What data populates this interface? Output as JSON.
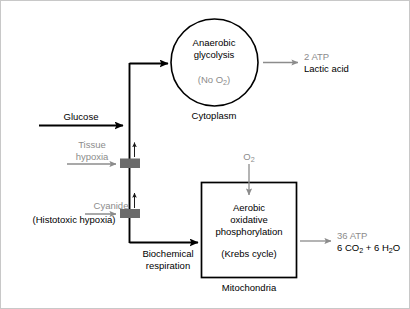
{
  "diagram": {
    "colors": {
      "black": "#000000",
      "gray_text": "#8c8c8c",
      "gray_arrow": "#8c8c8c",
      "block_gray": "#6b6b6b",
      "background": "#ffffff"
    },
    "inputs": {
      "glucose_label": "Glucose",
      "tissue_hypoxia_line1": "Tissue",
      "tissue_hypoxia_line2": "hypoxia",
      "cyanide_label": "Cyanide",
      "histotoxic_label": "(Histotoxic hypoxia)",
      "oxygen_label": "O",
      "oxygen_sub": "2"
    },
    "pathway": {
      "branch_label_line1": "Biochemical",
      "branch_label_line2": "respiration"
    },
    "anaerobic": {
      "title_line1": "Anaerobic",
      "title_line2": "glycolysis",
      "condition_prefix": "(No O",
      "condition_sub": "2",
      "condition_suffix": ")",
      "compartment_label": "Cytoplasm",
      "output_atp": "2 ATP",
      "output_product": "Lactic acid"
    },
    "aerobic": {
      "title_line1": "Aerobic",
      "title_line2": "oxidative",
      "title_line3": "phosphorylation",
      "cycle_label": "(Krebs cycle)",
      "compartment_label": "Mitochondria",
      "output_atp": "36 ATP",
      "output_product_prefix": "6 CO",
      "output_product_sub1": "2",
      "output_product_mid": " + 6 H",
      "output_product_sub2": "2",
      "output_product_suffix": "O"
    }
  }
}
